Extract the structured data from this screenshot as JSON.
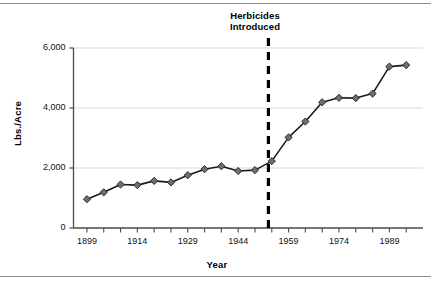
{
  "chart_data": {
    "type": "line",
    "title": "",
    "xlabel": "Year",
    "ylabel": "Lbs./Acre",
    "xlim": [
      1895,
      1999
    ],
    "ylim": [
      0,
      6000
    ],
    "grid": true,
    "legend": null,
    "ytick_labels": [
      "0",
      "2,000",
      "4,000",
      "6,000"
    ],
    "ytick_values": [
      0,
      2000,
      4000,
      6000
    ],
    "xtick_labels": [
      "1899",
      "1914",
      "1929",
      "1944",
      "1959",
      "1974",
      "1989"
    ],
    "xtick_values": [
      1899,
      1914,
      1929,
      1944,
      1959,
      1974,
      1989
    ],
    "series": [
      {
        "name": "Fertilizer use",
        "marker": "diamond",
        "marker_color": "#6e6e6e",
        "line_color": "#1a1a1a",
        "x": [
          1899,
          1904,
          1909,
          1914,
          1919,
          1924,
          1929,
          1934,
          1939,
          1944,
          1949,
          1954,
          1959,
          1964,
          1969,
          1974,
          1979,
          1984,
          1989,
          1994
        ],
        "values": [
          960,
          1190,
          1450,
          1430,
          1570,
          1520,
          1760,
          1960,
          2060,
          1900,
          1930,
          2230,
          3020,
          3550,
          4190,
          4340,
          4330,
          4480,
          5380,
          5430
        ]
      }
    ],
    "annotations": [
      {
        "name": "herbicides-introduced",
        "text_line_1": "Herbicides",
        "text_line_2": "Introduced",
        "x": 1953,
        "style": "dashed-vertical-line",
        "color": "#000000"
      }
    ]
  }
}
